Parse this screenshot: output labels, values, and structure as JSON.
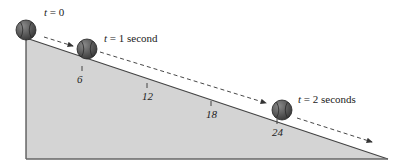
{
  "diagram": {
    "colors": {
      "incline_fill": "#d4d4d4",
      "incline_edge": "#444444",
      "ball_fill": "#555555",
      "ball_seam": "#2a2a2a",
      "arrow": "#333333",
      "text": "#222222"
    },
    "incline": {
      "top": [
        26,
        38
      ],
      "bottom_left": [
        26,
        159
      ],
      "bottom_right": [
        388,
        159
      ]
    },
    "ticks": [
      {
        "label": "6",
        "x": 82,
        "y": 67
      },
      {
        "label": "12",
        "x": 147,
        "y": 84
      },
      {
        "label": "18",
        "x": 211,
        "y": 102
      },
      {
        "label": "24",
        "x": 277,
        "y": 120
      }
    ],
    "balls": [
      {
        "time_var": "t",
        "time_label": "= 0",
        "cx": 26,
        "cy": 30,
        "r": 10,
        "label_x": 44,
        "label_y": 16
      },
      {
        "time_var": "t",
        "time_label": "= 1 second",
        "cx": 87,
        "cy": 49,
        "r": 10,
        "label_x": 104,
        "label_y": 42
      },
      {
        "time_var": "t",
        "time_label": "= 2 seconds",
        "cx": 282,
        "cy": 110,
        "r": 10,
        "label_x": 298,
        "label_y": 103
      }
    ],
    "arrows": [
      {
        "x1": 44,
        "y1": 37,
        "x2": 73,
        "y2": 46
      },
      {
        "x1": 100,
        "y1": 52,
        "x2": 266,
        "y2": 103
      },
      {
        "x1": 297,
        "y1": 118,
        "x2": 372,
        "y2": 142
      }
    ]
  }
}
